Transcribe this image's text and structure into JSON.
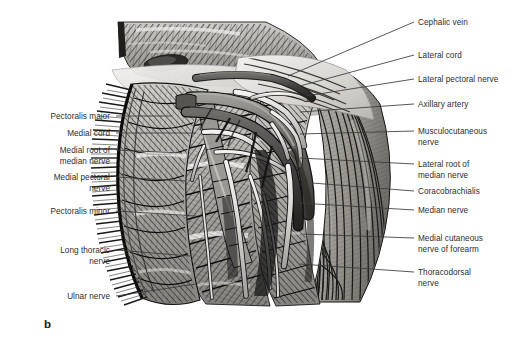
{
  "figure": {
    "panel_letter": "b",
    "text_color": "#2d2d2d",
    "leader_color": "#3a3a3a",
    "background": "#ffffff"
  },
  "labels_left": [
    {
      "text": "Pectoralis major",
      "x": 110,
      "y": 112,
      "lx1": 116,
      "ly1": 116,
      "lx2": 172,
      "ly2": 116
    },
    {
      "text": "Medial cord",
      "x": 110,
      "y": 129,
      "lx1": 116,
      "ly1": 133,
      "lx2": 196,
      "ly2": 133
    },
    {
      "text": "Medial root of\nmedian nerve",
      "x": 110,
      "y": 146,
      "lx1": 116,
      "ly1": 150,
      "lx2": 182,
      "ly2": 153
    },
    {
      "text": "Medial pectoral\nnerve",
      "x": 110,
      "y": 173,
      "lx1": 116,
      "ly1": 177,
      "lx2": 186,
      "ly2": 181
    },
    {
      "text": "Pectoralis minor",
      "x": 110,
      "y": 207,
      "lx1": 116,
      "ly1": 211,
      "lx2": 196,
      "ly2": 216
    },
    {
      "text": "Long thoracic\nnerve",
      "x": 110,
      "y": 246,
      "lx1": 116,
      "ly1": 250,
      "lx2": 190,
      "ly2": 256
    },
    {
      "text": "Ulnar nerve",
      "x": 110,
      "y": 292,
      "lx1": 116,
      "ly1": 296,
      "lx2": 196,
      "ly2": 284
    }
  ],
  "labels_right": [
    {
      "text": "Cephalic vein",
      "x": 418,
      "y": 18,
      "lx1": 414,
      "ly1": 22,
      "lx2": 288,
      "ly2": 76
    },
    {
      "text": "Lateral cord",
      "x": 418,
      "y": 51,
      "lx1": 414,
      "ly1": 55,
      "lx2": 300,
      "ly2": 86
    },
    {
      "text": "Lateral pectoral nerve",
      "x": 418,
      "y": 75,
      "lx1": 414,
      "ly1": 79,
      "lx2": 306,
      "ly2": 96
    },
    {
      "text": "Axillary artery",
      "x": 418,
      "y": 100,
      "lx1": 414,
      "ly1": 104,
      "lx2": 300,
      "ly2": 112
    },
    {
      "text": "Musculocutaneous\nnerve",
      "x": 418,
      "y": 127,
      "lx1": 414,
      "ly1": 131,
      "lx2": 300,
      "ly2": 134
    },
    {
      "text": "Lateral root of\nmedian nerve",
      "x": 418,
      "y": 160,
      "lx1": 414,
      "ly1": 164,
      "lx2": 300,
      "ly2": 158
    },
    {
      "text": "Coracobrachialis",
      "x": 418,
      "y": 187,
      "lx1": 414,
      "ly1": 191,
      "lx2": 312,
      "ly2": 183
    },
    {
      "text": "Median nerve",
      "x": 418,
      "y": 206,
      "lx1": 414,
      "ly1": 210,
      "lx2": 300,
      "ly2": 203
    },
    {
      "text": "Medial cutaneous\nnerve of forearm",
      "x": 418,
      "y": 234,
      "lx1": 414,
      "ly1": 238,
      "lx2": 300,
      "ly2": 234
    },
    {
      "text": "Thoracodorsal\nnerve",
      "x": 418,
      "y": 268,
      "lx1": 414,
      "ly1": 272,
      "lx2": 300,
      "ly2": 264
    }
  ]
}
